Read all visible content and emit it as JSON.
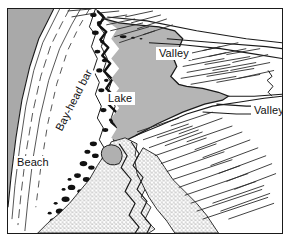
{
  "figure": {
    "kind": "geomorphology-block-diagram",
    "title_alt": "Coastal landform diagram: bay-head bar impounding a lake",
    "frame": {
      "stroke": "#1a1a1a",
      "fill": "#ffffff"
    }
  },
  "labels": {
    "lake": "Lake",
    "beach": "Beach",
    "bay_head_bar": "Bay-head bar",
    "valley_upper": "Valley",
    "valley_lower": "Valley"
  },
  "colors": {
    "ink": "#1a1a1a",
    "sea_gray": "#a9a9a9",
    "lake_gray": "#b5b5b5",
    "stipple_gray": "#cfcfcf",
    "paper": "#ffffff",
    "label_text": "#111111"
  },
  "features": [
    {
      "name": "sea",
      "shading": "solid-gray",
      "position": "upper-left-margin"
    },
    {
      "name": "beach",
      "shading": "white-with-parallel-strand-lines",
      "position": "left"
    },
    {
      "name": "bay-head-bar",
      "shading": "dark-blob-texture",
      "position": "left-center-diagonal"
    },
    {
      "name": "lake",
      "shading": "solid-gray",
      "position": "center"
    },
    {
      "name": "delta-alluvium",
      "shading": "stipple",
      "position": "lower-center"
    },
    {
      "name": "valley-upper",
      "shading": "hachured-slopes",
      "position": "upper-right"
    },
    {
      "name": "valley-lower",
      "shading": "hachured-slopes",
      "position": "right"
    },
    {
      "name": "uplands",
      "shading": "hachured-slopes",
      "position": "right-and-lower-right"
    }
  ]
}
